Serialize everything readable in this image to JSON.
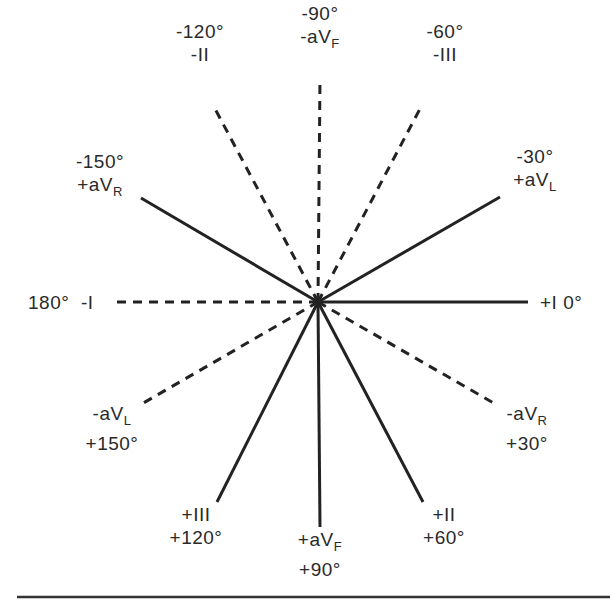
{
  "figure": {
    "center": {
      "x": 318,
      "y": 302
    },
    "colors": {
      "line": "#222222",
      "text": "#2a2a2a",
      "background": "#ffffff"
    },
    "leads": [
      {
        "id": "plus-I",
        "angle": "0°",
        "lead": "+I",
        "style": "solid",
        "end": {
          "x": 528,
          "y": 302
        }
      },
      {
        "id": "minus-aVR",
        "angle": "+30°",
        "lead": "-aV",
        "sub": "R",
        "style": "dashed",
        "end": {
          "x": 497,
          "y": 405
        }
      },
      {
        "id": "plus-II",
        "angle": "+60°",
        "lead": "+II",
        "style": "solid",
        "end": {
          "x": 423,
          "y": 502
        }
      },
      {
        "id": "plus-aVF",
        "angle": "+90°",
        "lead": "+aV",
        "sub": "F",
        "style": "solid",
        "end": {
          "x": 320,
          "y": 527
        }
      },
      {
        "id": "plus-III",
        "angle": "+120°",
        "lead": "+III",
        "style": "solid",
        "end": {
          "x": 217,
          "y": 502
        }
      },
      {
        "id": "minus-aVL",
        "angle": "+150°",
        "lead": "-aV",
        "sub": "L",
        "style": "dashed",
        "end": {
          "x": 140,
          "y": 405
        }
      },
      {
        "id": "minus-I",
        "angle": "180°",
        "lead": "-I",
        "style": "dashed",
        "end": {
          "x": 113,
          "y": 302
        }
      },
      {
        "id": "plus-aVR",
        "angle": "-150°",
        "lead": "+aV",
        "sub": "R",
        "style": "solid",
        "end": {
          "x": 141,
          "y": 198
        }
      },
      {
        "id": "minus-II",
        "angle": "-120°",
        "lead": "-II",
        "style": "dashed",
        "end": {
          "x": 213,
          "y": 105
        }
      },
      {
        "id": "minus-aVF",
        "angle": "-90°",
        "lead": "-aV",
        "sub": "F",
        "style": "dashed",
        "end": {
          "x": 320,
          "y": 78
        }
      },
      {
        "id": "minus-III",
        "angle": "-60°",
        "lead": "-III",
        "style": "dashed",
        "end": {
          "x": 422,
          "y": 105
        }
      },
      {
        "id": "plus-aVL",
        "angle": "-30°",
        "lead": "+aV",
        "sub": "L",
        "style": "solid",
        "end": {
          "x": 500,
          "y": 197
        }
      }
    ],
    "labels": {
      "minus90": {
        "angle": "-90°",
        "lead": "-aV",
        "sub": "F"
      },
      "minus120": {
        "angle": "-120°",
        "lead": "-II"
      },
      "minus60": {
        "angle": "-60°",
        "lead": "-III"
      },
      "minus150": {
        "angle": "-150°",
        "lead": "+aV",
        "sub": "R"
      },
      "minus30": {
        "angle": "-30°",
        "lead": "+aV",
        "sub": "L"
      },
      "deg180": {
        "angle": "180°",
        "lead": "-I"
      },
      "deg0": {
        "lead": "+I",
        "angle": "0°"
      },
      "plus150": {
        "lead": "-aV",
        "sub": "L",
        "angle": "+150°"
      },
      "plus30": {
        "lead": "-aV",
        "sub": "R",
        "angle": "+30°"
      },
      "plus120": {
        "lead": "+III",
        "angle": "+120°"
      },
      "plus90": {
        "lead": "+aV",
        "sub": "F",
        "angle": "+90°"
      },
      "plus60": {
        "lead": "+II",
        "angle": "+60°"
      }
    },
    "bottom_rule": {
      "x1": 17,
      "x2": 610,
      "y": 597
    }
  }
}
